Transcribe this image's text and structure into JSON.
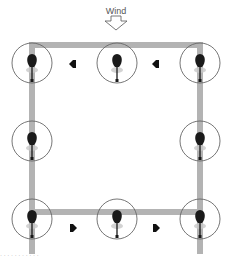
{
  "diagram": {
    "wind": {
      "label": "Wind",
      "direction": "down",
      "position": {
        "x": 116,
        "y": 16
      }
    },
    "frame": {
      "color": "#b3b3b3",
      "top_y": 45,
      "bottom_y": 212,
      "left_x": 32,
      "right_x": 200,
      "thickness": 6
    },
    "rotors": [
      {
        "id": "top-left",
        "x": 32,
        "y": 62
      },
      {
        "id": "top-center",
        "x": 117,
        "y": 62
      },
      {
        "id": "top-right",
        "x": 200,
        "y": 62
      },
      {
        "id": "middle-left",
        "x": 32,
        "y": 140
      },
      {
        "id": "middle-right",
        "x": 200,
        "y": 140
      },
      {
        "id": "bottom-left",
        "x": 32,
        "y": 218
      },
      {
        "id": "bottom-center",
        "x": 117,
        "y": 218
      },
      {
        "id": "bottom-right",
        "x": 200,
        "y": 218
      }
    ],
    "flow_arrows": [
      {
        "id": "top-arrow-1",
        "x": 73,
        "y": 64,
        "direction": "left"
      },
      {
        "id": "top-arrow-2",
        "x": 156,
        "y": 64,
        "direction": "left"
      },
      {
        "id": "bottom-arrow-1",
        "x": 73,
        "y": 228,
        "direction": "right"
      },
      {
        "id": "bottom-arrow-2",
        "x": 156,
        "y": 228,
        "direction": "right"
      }
    ],
    "circle_radius": 20,
    "colors": {
      "rotor_body": "#1a1a1a",
      "circle": "#666666",
      "shadow": "#c8c8c8",
      "arrow": "#111111",
      "wind_arrow_stroke": "#555555"
    },
    "caption": "· · · · · · · · · · ·"
  }
}
